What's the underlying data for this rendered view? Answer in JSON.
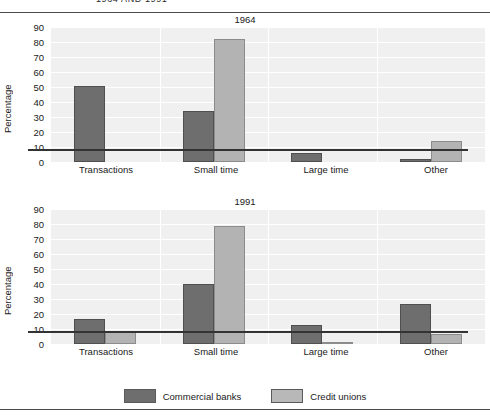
{
  "page": {
    "header_title": "1964 AND 1991"
  },
  "legend": {
    "position": "bottom-center",
    "entries": [
      {
        "label": "Commercial banks",
        "color": "#6e6e6e",
        "swatch_name": "legend-swatch-commercial-banks"
      },
      {
        "label": "Credit unions",
        "color": "#b8b8b8",
        "swatch_name": "legend-swatch-credit-unions"
      }
    ]
  },
  "axis": {
    "ylabel": "Percentage",
    "yticks": [
      "0",
      "10",
      "20",
      "30",
      "40",
      "50",
      "60",
      "70",
      "80",
      "90"
    ]
  },
  "chart_data": [
    {
      "type": "bar",
      "title": "1964",
      "xlabel": "",
      "ylabel": "Percentage",
      "ylim": [
        0,
        90
      ],
      "ytick_step": 10,
      "grid": true,
      "legend_position": "bottom",
      "categories": [
        "Transactions",
        "Small time",
        "Large time",
        "Other"
      ],
      "series": [
        {
          "name": "Commercial banks",
          "color": "#6e6e6e",
          "values": [
            51,
            34,
            6,
            2
          ]
        },
        {
          "name": "Credit unions",
          "color": "#b3b3b3",
          "values": [
            0,
            82,
            0,
            14
          ]
        }
      ]
    },
    {
      "type": "bar",
      "title": "1991",
      "xlabel": "",
      "ylabel": "Percentage",
      "ylim": [
        0,
        90
      ],
      "ytick_step": 10,
      "grid": true,
      "legend_position": "bottom",
      "categories": [
        "Transactions",
        "Small time",
        "Large time",
        "Other"
      ],
      "series": [
        {
          "name": "Commercial banks",
          "color": "#6e6e6e",
          "values": [
            17,
            40,
            13,
            27
          ]
        },
        {
          "name": "Credit unions",
          "color": "#b3b3b3",
          "values": [
            9,
            79,
            1,
            7
          ]
        }
      ]
    }
  ]
}
